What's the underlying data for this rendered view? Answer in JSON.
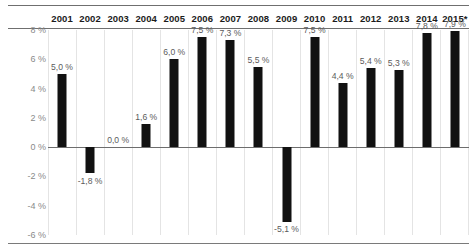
{
  "chart_data": {
    "type": "bar",
    "title": "",
    "subtitle": "",
    "xlabel": "",
    "ylabel": "",
    "categories": [
      "2001",
      "2002",
      "2003",
      "2004",
      "2005",
      "2006",
      "2007",
      "2008",
      "2009",
      "2010",
      "2011",
      "2012",
      "2013",
      "2014",
      "2015*"
    ],
    "values": [
      5.0,
      -1.8,
      0.0,
      1.6,
      6.0,
      7.5,
      7.3,
      5.5,
      -5.1,
      7.5,
      4.4,
      5.4,
      5.3,
      7.8,
      7.9
    ],
    "data_labels": [
      "5,0 %",
      "-1,8 %",
      "0,0 %",
      "1,6 %",
      "6,0 %",
      "7,5 %",
      "7,3 %",
      "5,5 %",
      "-5,1 %",
      "7,5 %",
      "4,4 %",
      "5,4 %",
      "5,3 %",
      "7,8 %",
      "7,9 %"
    ],
    "ylim": [
      -6,
      8
    ],
    "ytick_values": [
      8,
      6,
      4,
      2,
      0,
      -2,
      -4,
      -6
    ],
    "ytick_labels": [
      "8 %",
      "6 %",
      "4 %",
      "2 %",
      "0 %",
      "-2 %",
      "-4 %",
      "-6 %"
    ],
    "grid": {
      "horizontal": false,
      "vertical": true,
      "zero_line": true
    },
    "legend": {
      "visible": false,
      "position": "none"
    },
    "colors": {
      "bar": "#111111",
      "background": "#ffffff",
      "gridline": "#e4e4e4",
      "zero_line": "#6d6d6d",
      "axis_label": "#8a8a8a",
      "data_label": "#5b5b5b",
      "header_text": "#1b1b1b",
      "rule": "#6f6f6f"
    }
  },
  "header": {
    "years": [
      "2001",
      "2002",
      "2003",
      "2004",
      "2005",
      "2006",
      "2007",
      "2008",
      "2009",
      "2010",
      "2011",
      "2012",
      "2013",
      "2014",
      "2015*"
    ]
  },
  "y_axis": {
    "labels": [
      "8 %",
      "6 %",
      "4 %",
      "2 %",
      "0 %",
      "-2 %",
      "-4 %",
      "-6 %"
    ]
  }
}
